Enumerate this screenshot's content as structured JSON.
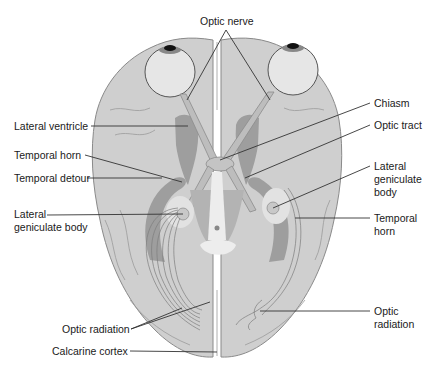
{
  "figure": {
    "colors": {
      "background": "#ffffff",
      "brain": "#cfcfcf",
      "ventricle": "#9e9e9e",
      "deep_structures": "#b3b3b3",
      "label_text": "#1a1a1a"
    }
  },
  "labels": {
    "optic_nerve": "Optic  nerve",
    "chiasm": "Chiasm",
    "optic_tract": "Optic tract",
    "lateral_ventricle": "Lateral ventricle",
    "temporal_horn_left": "Temporal horn",
    "temporal_detour": "Temporal detour",
    "lgb_left_line1": "Lateral",
    "lgb_left_line2": "geniculate body",
    "lgb_right_line1": "Lateral",
    "lgb_right_line2": "geniculate",
    "lgb_right_line3": "body",
    "temporal_horn_right_line1": "Temporal",
    "temporal_horn_right_line2": "horn",
    "optic_radiation_left": "Optic radiation",
    "optic_radiation_right_line1": "Optic",
    "optic_radiation_right_line2": "radiation",
    "calcarine_cortex": "Calcarine cortex"
  }
}
